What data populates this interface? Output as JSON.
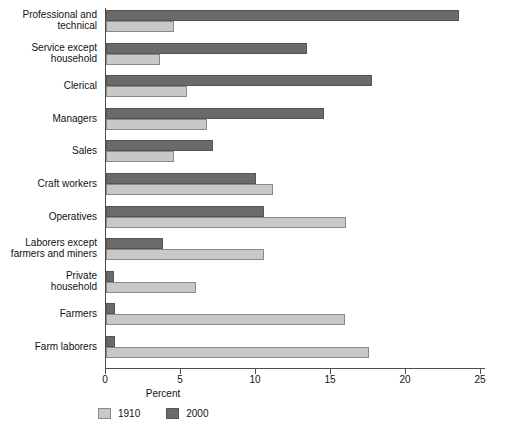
{
  "chart_data": {
    "type": "bar",
    "orientation": "horizontal",
    "title": "",
    "xlabel": "Percent",
    "ylabel": "",
    "xlim": [
      0,
      25
    ],
    "xticks": [
      0,
      5,
      10,
      15,
      20,
      25
    ],
    "xtick_labels": [
      "0",
      "5",
      "10",
      "15",
      "20",
      "25"
    ],
    "grid": false,
    "legend_position": "bottom-left",
    "categories": [
      "Professional and\ntechnical",
      "Service except\nhousehold",
      "Clerical",
      "Managers",
      "Sales",
      "Craft workers",
      "Operatives",
      "Laborers except\nfarmers and miners",
      "Private\nhousehold",
      "Farmers",
      "Farm laborers"
    ],
    "series": [
      {
        "name": "1910",
        "color": "#c8c8c8",
        "values": [
          4.5,
          3.6,
          5.4,
          6.7,
          4.5,
          11.1,
          16.0,
          10.5,
          6.0,
          15.9,
          17.5
        ]
      },
      {
        "name": "2000",
        "color": "#6a6a6a",
        "values": [
          23.5,
          13.4,
          17.7,
          14.5,
          7.1,
          10.0,
          10.5,
          3.8,
          0.5,
          0.6,
          0.6
        ]
      }
    ]
  },
  "legend": {
    "entries": [
      {
        "label": "1910",
        "swatch": "light-gray-swatch"
      },
      {
        "label": "2000",
        "swatch": "dark-gray-swatch"
      }
    ]
  }
}
